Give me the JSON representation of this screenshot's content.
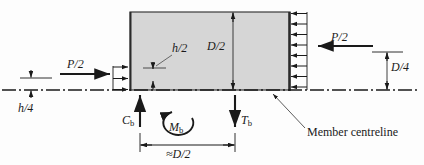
{
  "figure": {
    "type": "engineering-free-body-diagram",
    "colors": {
      "panel_fill": "#d6d6d6",
      "panel_stroke": "#3a3a3a",
      "line": "#1a1a1a",
      "background": "#fdfdfd"
    }
  },
  "labels": {
    "load_left": "P/2",
    "load_right": "P/2",
    "dim_h_half": "h/2",
    "dim_h_quarter": "h/4",
    "dim_d_half": "D/2",
    "dim_d_quarter": "D/4",
    "force_compression": "C",
    "force_compression_sub": "b",
    "force_tension": "T",
    "force_tension_sub": "b",
    "moment": "M",
    "moment_sub": "b",
    "dim_spacing": "≈D/2",
    "centreline_callout": "Member centreline"
  },
  "geometry": {
    "panel": {
      "x": 130,
      "y": 12,
      "width": 160,
      "height": 78
    },
    "centreline_y": 90,
    "left_load_arrow_count": 3,
    "right_load_arrow_count": 8
  }
}
